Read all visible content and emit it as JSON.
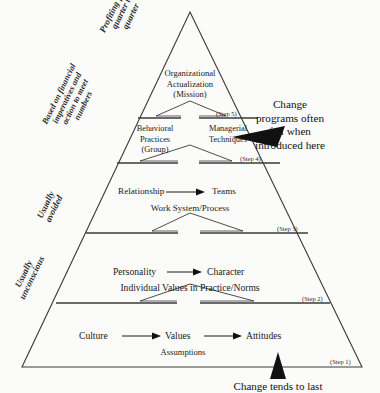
{
  "diagram": {
    "apex_label": "",
    "edge_labels": [
      {
        "id": "profiting",
        "text_lines": [
          "Profiting from",
          "quarter to",
          "quarter"
        ]
      },
      {
        "id": "financial",
        "text_lines": [
          "Based on financial",
          "imperatives and",
          "action to meet",
          "numbers"
        ]
      },
      {
        "id": "avoided",
        "text_lines": [
          "Usually",
          "avoided"
        ]
      },
      {
        "id": "unconscious",
        "text_lines": [
          "Usually",
          "unconscious"
        ]
      }
    ],
    "steps": [
      {
        "id": "step5",
        "label": "(Step 5)"
      },
      {
        "id": "step4",
        "label": "(Step 4)"
      },
      {
        "id": "step3",
        "label": "(Step 3)"
      },
      {
        "id": "step2",
        "label": "(Step 2)"
      },
      {
        "id": "step1",
        "label": "(Step 1)"
      }
    ],
    "bands": [
      {
        "id": "apex-band",
        "lines": [
          "Organizational",
          "Actualization",
          "(Mission)"
        ]
      },
      {
        "id": "practices-band",
        "left_lines": [
          "Behavioral",
          "Practices",
          "(Group)"
        ],
        "right_lines": [
          "Managerial",
          "Techniques"
        ]
      },
      {
        "id": "relationship-band",
        "left": "Relationship",
        "right": "Teams",
        "sub": "Work System/Process"
      },
      {
        "id": "personality-band",
        "left": "Personality",
        "right": "Character",
        "sub": "Individual Values in Practice/Norms"
      },
      {
        "id": "culture-band",
        "first": "Culture",
        "second": "Values",
        "third": "Attitudes",
        "sub": "Assumptions"
      }
    ],
    "annotations": [
      {
        "id": "fail-note",
        "lines": [
          "Change",
          "programs often",
          "fail when",
          "introduced here"
        ]
      },
      {
        "id": "last-note",
        "lines": [
          "Change tends to last"
        ]
      }
    ],
    "colors": {
      "stroke": "#3a3a3a",
      "arrow_fill": "#111111",
      "background": "#fbfbfa",
      "text": "#1a1a1a"
    }
  }
}
